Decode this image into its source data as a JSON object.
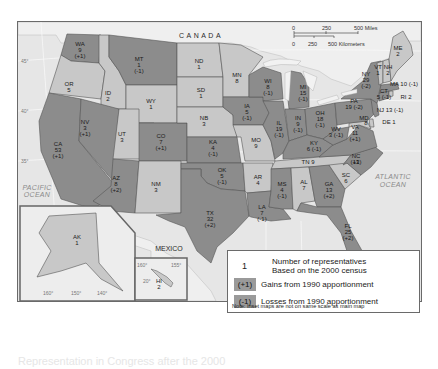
{
  "map": {
    "labels": {
      "canada": "CANADA",
      "mexico": "MEXICO",
      "pacific_ocean_1": "PACIFIC",
      "pacific_ocean_2": "OCEAN",
      "atlantic_ocean_1": "ATLANTIC",
      "atlantic_ocean_2": "OCEAN"
    },
    "scale_bar": {
      "miles": [
        "0",
        "250",
        "500 Miles"
      ],
      "kilometers": [
        "0",
        "250",
        "500 Kilometers"
      ]
    },
    "latitude_ticks": [
      "45°",
      "40°",
      "35°"
    ],
    "longitude_ticks": [
      "95°",
      "90°",
      "85°"
    ],
    "alaska_ticks": [
      "160°",
      "150°",
      "140°"
    ],
    "hawaii_ticks": [
      "160°",
      "155°",
      "20°"
    ],
    "colors": {
      "gain": "#8c8c8c",
      "loss": "#8c8c8c",
      "no_change": "#c8c8c8",
      "water": "#e6e6e6",
      "border": "#555555"
    },
    "states": [
      {
        "abbr": "WA",
        "reps": "9",
        "change": "(+1)"
      },
      {
        "abbr": "OR",
        "reps": "5",
        "change": ""
      },
      {
        "abbr": "CA",
        "reps": "53",
        "change": "(+1)"
      },
      {
        "abbr": "ID",
        "reps": "2",
        "change": ""
      },
      {
        "abbr": "NV",
        "reps": "3",
        "change": "(+1)"
      },
      {
        "abbr": "MT",
        "reps": "1",
        "change": "(-1)"
      },
      {
        "abbr": "WY",
        "reps": "1",
        "change": ""
      },
      {
        "abbr": "UT",
        "reps": "3",
        "change": ""
      },
      {
        "abbr": "AZ",
        "reps": "8",
        "change": "(+2)"
      },
      {
        "abbr": "CO",
        "reps": "7",
        "change": "(+1)"
      },
      {
        "abbr": "NM",
        "reps": "3",
        "change": ""
      },
      {
        "abbr": "ND",
        "reps": "1",
        "change": ""
      },
      {
        "abbr": "SD",
        "reps": "1",
        "change": ""
      },
      {
        "abbr": "NB",
        "reps": "3",
        "change": ""
      },
      {
        "abbr": "KA",
        "reps": "4",
        "change": "(-1)"
      },
      {
        "abbr": "OK",
        "reps": "5",
        "change": "(-1)"
      },
      {
        "abbr": "TX",
        "reps": "32",
        "change": "(+2)"
      },
      {
        "abbr": "MN",
        "reps": "8",
        "change": ""
      },
      {
        "abbr": "IA",
        "reps": "5",
        "change": "(-1)"
      },
      {
        "abbr": "MO",
        "reps": "9",
        "change": ""
      },
      {
        "abbr": "AR",
        "reps": "4",
        "change": ""
      },
      {
        "abbr": "LA",
        "reps": "7",
        "change": "(-1)"
      },
      {
        "abbr": "WI",
        "reps": "8",
        "change": "(-1)"
      },
      {
        "abbr": "IL",
        "reps": "19",
        "change": "(-1)"
      },
      {
        "abbr": "MI",
        "reps": "15",
        "change": "(-1)"
      },
      {
        "abbr": "IN",
        "reps": "9",
        "change": "(-1)"
      },
      {
        "abbr": "OH",
        "reps": "18",
        "change": "(-1)"
      },
      {
        "abbr": "KY",
        "reps": "6",
        "change": "(-1)"
      },
      {
        "abbr": "TN",
        "reps": "9",
        "change": ""
      },
      {
        "abbr": "MS",
        "reps": "4",
        "change": "(-1)"
      },
      {
        "abbr": "AL",
        "reps": "7",
        "change": ""
      },
      {
        "abbr": "GA",
        "reps": "13",
        "change": "(+2)"
      },
      {
        "abbr": "FL",
        "reps": "25",
        "change": "(+2)"
      },
      {
        "abbr": "SC",
        "reps": "6",
        "change": ""
      },
      {
        "abbr": "NC",
        "reps": "13",
        "change": "(+1)"
      },
      {
        "abbr": "VA",
        "reps": "11",
        "change": "(+1)"
      },
      {
        "abbr": "WV",
        "reps": "3",
        "change": "(-1)"
      },
      {
        "abbr": "MD",
        "reps": "8",
        "change": ""
      },
      {
        "abbr": "DE",
        "reps": "1",
        "change": ""
      },
      {
        "abbr": "PA",
        "reps": "19",
        "change": "(-2)"
      },
      {
        "abbr": "NJ",
        "reps": "13",
        "change": "(-1)"
      },
      {
        "abbr": "NY",
        "reps": "29",
        "change": "(-2)"
      },
      {
        "abbr": "CT",
        "reps": "5",
        "change": "(-1)"
      },
      {
        "abbr": "RI",
        "reps": "2",
        "change": ""
      },
      {
        "abbr": "MA",
        "reps": "10",
        "change": "(-1)"
      },
      {
        "abbr": "VT",
        "reps": "1",
        "change": ""
      },
      {
        "abbr": "NH",
        "reps": "2",
        "change": ""
      },
      {
        "abbr": "ME",
        "reps": "2",
        "change": ""
      },
      {
        "abbr": "AK",
        "reps": "1",
        "change": ""
      },
      {
        "abbr": "HI",
        "reps": "2",
        "change": ""
      }
    ],
    "inline_labels": {
      "tn": "TN 9",
      "wv": "3 (-1)",
      "ky": "6 (-1)",
      "pa": "19 (-2)",
      "nj": "NJ 13 (-1)",
      "de": "DE 1",
      "ma": "MA 10 (-1)",
      "ct": "5 (-1)",
      "ri": "RI 2"
    }
  },
  "legend": {
    "number_example": "1",
    "number_desc_line1": "Number of representatives",
    "number_desc_line2": "Based on the 2000 census",
    "gain_swatch": "(+1)",
    "gain_desc": "Gains from 1990 apportionment",
    "loss_swatch": "(-1)",
    "loss_desc": "Losses from 1990 apportionment",
    "note": "Note: Inset maps are not on same scale as main map"
  },
  "caption": "Representation in Congress after the 2000"
}
